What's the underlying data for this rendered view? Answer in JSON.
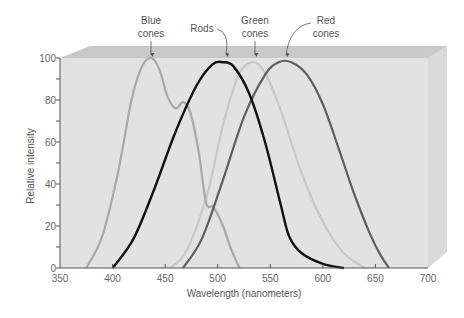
{
  "chart_data": {
    "type": "line",
    "title": "",
    "xlabel": "Wavelength (nanometers)",
    "ylabel": "Relative intensity",
    "xlim": [
      350,
      700
    ],
    "ylim": [
      0,
      100
    ],
    "x_ticks": [
      350,
      400,
      450,
      500,
      550,
      600,
      650,
      700
    ],
    "y_ticks": [
      0,
      20,
      40,
      60,
      80,
      100
    ],
    "grid": false,
    "legend": "callout labels above curves",
    "series": [
      {
        "name": "Blue cones",
        "color": "#a8a8a8",
        "peak_nm": 437,
        "points": [
          [
            375,
            0
          ],
          [
            390,
            15
          ],
          [
            405,
            45
          ],
          [
            418,
            80
          ],
          [
            428,
            96
          ],
          [
            437,
            100
          ],
          [
            445,
            94
          ],
          [
            452,
            82
          ],
          [
            460,
            76
          ],
          [
            467,
            79
          ],
          [
            474,
            74
          ],
          [
            482,
            55
          ],
          [
            489,
            31
          ],
          [
            496,
            29
          ],
          [
            505,
            20
          ],
          [
            512,
            10
          ],
          [
            518,
            3
          ],
          [
            521,
            0
          ]
        ]
      },
      {
        "name": "Rods",
        "color": "#111111",
        "peak_nm": 505,
        "points": [
          [
            400,
            0
          ],
          [
            420,
            14
          ],
          [
            440,
            38
          ],
          [
            460,
            65
          ],
          [
            480,
            87
          ],
          [
            495,
            97
          ],
          [
            505,
            98
          ],
          [
            515,
            96
          ],
          [
            530,
            83
          ],
          [
            545,
            60
          ],
          [
            560,
            30
          ],
          [
            568,
            15
          ],
          [
            580,
            7
          ],
          [
            600,
            2
          ],
          [
            620,
            0
          ]
        ]
      },
      {
        "name": "Green cones",
        "color": "#c8c8c8",
        "peak_nm": 533,
        "points": [
          [
            455,
            0
          ],
          [
            470,
            8
          ],
          [
            490,
            35
          ],
          [
            505,
            68
          ],
          [
            520,
            92
          ],
          [
            533,
            98
          ],
          [
            545,
            93
          ],
          [
            560,
            75
          ],
          [
            580,
            45
          ],
          [
            600,
            22
          ],
          [
            620,
            7
          ],
          [
            640,
            0
          ]
        ]
      },
      {
        "name": "Red cones",
        "color": "#5e5e5e",
        "peak_nm": 565,
        "points": [
          [
            467,
            0
          ],
          [
            485,
            14
          ],
          [
            505,
            42
          ],
          [
            525,
            72
          ],
          [
            545,
            92
          ],
          [
            558,
            98
          ],
          [
            570,
            98
          ],
          [
            585,
            92
          ],
          [
            600,
            78
          ],
          [
            615,
            57
          ],
          [
            630,
            35
          ],
          [
            645,
            16
          ],
          [
            655,
            6
          ],
          [
            663,
            0
          ]
        ]
      }
    ],
    "annotations": [
      {
        "label": "Blue cones",
        "points_to_nm": 437
      },
      {
        "label": "Rods",
        "points_to_nm": 505
      },
      {
        "label": "Green cones",
        "points_to_nm": 533
      },
      {
        "label": "Red cones",
        "points_to_nm": 558
      }
    ],
    "shaded_region": {
      "description": "overlap area under blue cone tail and red cone rise",
      "x_range_nm": [
        490,
        521
      ]
    }
  },
  "labels": {
    "blue_line1": "Blue",
    "blue_line2": "cones",
    "rods": "Rods",
    "green_line1": "Green",
    "green_line2": "cones",
    "red_line1": "Red",
    "red_line2": "cones",
    "xlabel": "Wavelength (nanometers)",
    "ylabel": "Relative intensity",
    "xt": [
      "350",
      "400",
      "450",
      "500",
      "550",
      "600",
      "650",
      "700"
    ],
    "yt": [
      "0",
      "20",
      "40",
      "60",
      "80",
      "100"
    ]
  }
}
